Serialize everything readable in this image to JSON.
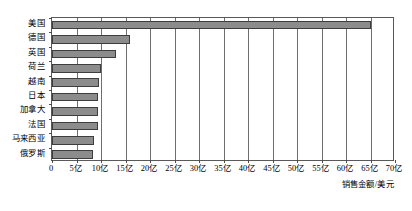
{
  "chart_data": {
    "type": "bar",
    "orientation": "horizontal",
    "title": "",
    "subtitle": "",
    "xlabel": "销售金额/美元",
    "ylabel": "",
    "categories": [
      "美国",
      "德国",
      "英国",
      "荷兰",
      "越南",
      "日本",
      "加拿大",
      "法国",
      "马来西亚",
      "俄罗斯"
    ],
    "values": [
      65,
      16,
      13,
      10,
      9.5,
      9.3,
      9.3,
      9.3,
      8.6,
      8.3
    ],
    "value_unit": "亿",
    "xlim": [
      0,
      70
    ],
    "xticks": [
      0,
      5,
      10,
      15,
      20,
      25,
      30,
      35,
      40,
      45,
      50,
      55,
      60,
      65,
      70
    ],
    "xtick_labels": [
      "0",
      "5亿",
      "10亿",
      "15亿",
      "20亿",
      "25亿",
      "30亿",
      "35亿",
      "40亿",
      "45亿",
      "50亿",
      "55亿",
      "60亿",
      "65亿",
      "70亿"
    ],
    "grid": true,
    "grid_axis": "x",
    "legend": null,
    "series": [
      {
        "name": "销售金额",
        "values": [
          65,
          16,
          13,
          10,
          9.5,
          9.3,
          9.3,
          9.3,
          8.6,
          8.3
        ]
      }
    ],
    "bar_color": "#8c8c8c",
    "bar_border_color": "#3d3d3d",
    "grid_color": "#6e6e6e",
    "plot_border_color": "#595959",
    "background_color": "#ffffff"
  }
}
